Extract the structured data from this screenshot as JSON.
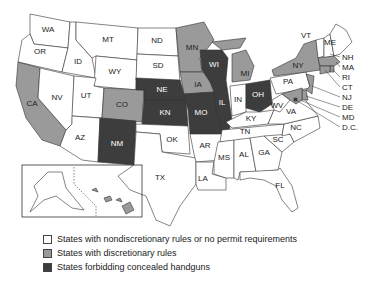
{
  "colors": {
    "nondiscretionary": "#ffffff",
    "discretionary": "#9a9a9a",
    "forbidding": "#3d3d3d"
  },
  "legend": [
    {
      "category": "nondiscretionary",
      "label": "States with nondiscretionary rules or no permit requirements"
    },
    {
      "category": "discretionary",
      "label": "States with discretionary rules"
    },
    {
      "category": "forbidding",
      "label": "States forbidding concealed handguns"
    }
  ],
  "states": {
    "WA": "nondiscretionary",
    "OR": "nondiscretionary",
    "CA": "discretionary",
    "ID": "nondiscretionary",
    "NV": "nondiscretionary",
    "MT": "nondiscretionary",
    "WY": "nondiscretionary",
    "UT": "nondiscretionary",
    "AZ": "nondiscretionary",
    "CO": "discretionary",
    "NM": "forbidding",
    "ND": "nondiscretionary",
    "SD": "nondiscretionary",
    "NE": "forbidding",
    "KN": "forbidding",
    "OK": "nondiscretionary",
    "TX": "nondiscretionary",
    "MN": "discretionary",
    "IA": "discretionary",
    "MO": "forbidding",
    "AR": "nondiscretionary",
    "LA": "nondiscretionary",
    "WI": "forbidding",
    "IL": "forbidding",
    "MI": "discretionary",
    "IN": "nondiscretionary",
    "OH": "forbidding",
    "KY": "nondiscretionary",
    "TN": "nondiscretionary",
    "MS": "nondiscretionary",
    "AL": "nondiscretionary",
    "GA": "nondiscretionary",
    "FL": "nondiscretionary",
    "SC": "nondiscretionary",
    "NC": "nondiscretionary",
    "VA": "nondiscretionary",
    "WV": "nondiscretionary",
    "PA": "nondiscretionary",
    "NY": "discretionary",
    "VT": "nondiscretionary",
    "ME": "nondiscretionary",
    "NH": "nondiscretionary",
    "MA": "discretionary",
    "RI": "discretionary",
    "CT": "discretionary",
    "NJ": "discretionary",
    "DE": "discretionary",
    "MD": "discretionary",
    "D.C.": "forbidding",
    "AK": "nondiscretionary",
    "HI": "discretionary"
  },
  "labels": {
    "WA": "WA",
    "OR": "OR",
    "CA": "CA",
    "ID": "ID",
    "NV": "NV",
    "MT": "MT",
    "WY": "WY",
    "UT": "UT",
    "AZ": "AZ",
    "CO": "CO",
    "NM": "NM",
    "ND": "ND",
    "SD": "SD",
    "NE": "NE",
    "KN": "KN",
    "OK": "OK",
    "TX": "TX",
    "MN": "MN",
    "IA": "IA",
    "MO": "MO",
    "AR": "AR",
    "LA": "LA",
    "WI": "WI",
    "IL": "IL",
    "MI": "MI",
    "IN": "IN",
    "OH": "OH",
    "KY": "KY",
    "TN": "TN",
    "MS": "MS",
    "AL": "AL",
    "GA": "GA",
    "FL": "FL",
    "SC": "SC",
    "NC": "NC",
    "VA": "VA",
    "WV": "WV",
    "PA": "PA",
    "NY": "NY",
    "VT": "VT",
    "ME": "ME"
  },
  "callouts": [
    "NH",
    "MA",
    "RI",
    "CT",
    "NJ",
    "DE",
    "MD",
    "D.C."
  ]
}
